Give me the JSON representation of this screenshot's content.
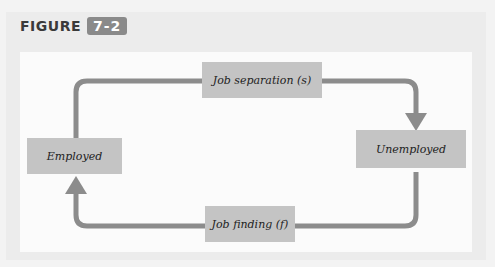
{
  "figure": {
    "label": "FIGURE",
    "number": "7-2"
  },
  "diagram": {
    "type": "flow-cycle",
    "nodes": {
      "employed": "Employed",
      "unemployed": "Unemployed",
      "job_separation": "Job separation (s)",
      "job_finding": "Job finding (f)"
    },
    "edges": [
      {
        "from": "Employed",
        "to": "Unemployed",
        "via": "Job separation (s)"
      },
      {
        "from": "Unemployed",
        "to": "Employed",
        "via": "Job finding (f)"
      }
    ],
    "colors": {
      "arrow": "#8c8c8c",
      "box": "#c4c4c4",
      "badge": "#8a8a8a"
    }
  }
}
